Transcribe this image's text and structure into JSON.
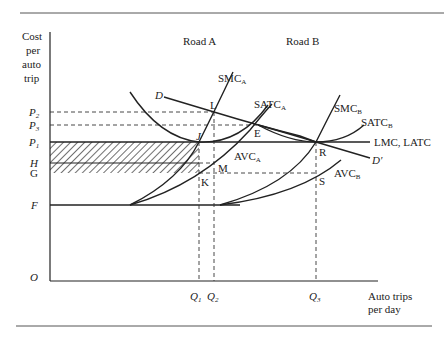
{
  "figure": {
    "y_axis_label": [
      "Cost",
      "per",
      "auto",
      "trip"
    ],
    "x_axis_label": [
      "Auto trips",
      "per day"
    ],
    "origin_label": "O",
    "region_labels": {
      "road_a": "Road A",
      "road_b": "Road B"
    },
    "y_ticks": [
      {
        "base": "P",
        "sub": "2"
      },
      {
        "base": "P",
        "sub": "3"
      },
      {
        "base": "P",
        "sub": "1"
      },
      {
        "base": "H",
        "sub": ""
      },
      {
        "base": "G",
        "sub": ""
      },
      {
        "base": "F",
        "sub": ""
      }
    ],
    "x_ticks": [
      {
        "base": "Q",
        "sub": "1"
      },
      {
        "base": "Q",
        "sub": "2"
      },
      {
        "base": "Q",
        "sub": "3"
      }
    ],
    "curve_labels": {
      "smc_a": {
        "base": "SMC",
        "sub": "A"
      },
      "satc_a": {
        "base": "SATC",
        "sub": "A"
      },
      "avc_a": {
        "base": "AVC",
        "sub": "A"
      },
      "smc_b": {
        "base": "SMC",
        "sub": "B"
      },
      "satc_b": {
        "base": "SATC",
        "sub": "B"
      },
      "avc_b": {
        "base": "AVC",
        "sub": "B"
      },
      "lmc_latc": "LMC, LATC",
      "demand": "D",
      "demand_prime": "D′"
    },
    "points": {
      "L": "L",
      "J": "J",
      "E": "E",
      "M": "M",
      "K": "K",
      "R": "R",
      "S": "S"
    },
    "shaded_region": "rectangle between P1 and G from axis to Q1 (hatched)"
  }
}
